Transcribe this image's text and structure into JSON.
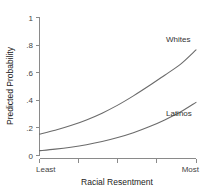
{
  "chart_data": {
    "type": "line",
    "title": "",
    "xlabel": "Racial Resentment",
    "ylabel": "Predicted Probability",
    "xlim": [
      0,
      1
    ],
    "ylim": [
      0,
      1
    ],
    "grid": false,
    "legend_position": "inline-right",
    "x_tick_labels": [
      "Least",
      "",
      "",
      "",
      "Most"
    ],
    "x_ticks": [
      0,
      0.25,
      0.5,
      0.75,
      1
    ],
    "y_ticks": [
      0,
      0.2,
      0.4,
      0.6,
      0.8,
      1
    ],
    "y_tick_labels": [
      "0",
      ".2",
      ".4",
      ".6",
      ".8",
      "1"
    ],
    "x": [
      0,
      0.1,
      0.2,
      0.3,
      0.4,
      0.5,
      0.6,
      0.7,
      0.8,
      0.9,
      1
    ],
    "series": [
      {
        "name": "Whites",
        "label": "Whites",
        "color": "#6b6b6b",
        "values": [
          0.155,
          0.183,
          0.217,
          0.258,
          0.307,
          0.365,
          0.432,
          0.505,
          0.582,
          0.66,
          0.765
        ]
      },
      {
        "name": "Latinos",
        "label": "Latinos",
        "color": "#6b6b6b",
        "values": [
          0.035,
          0.046,
          0.06,
          0.078,
          0.101,
          0.13,
          0.165,
          0.208,
          0.258,
          0.315,
          0.385
        ]
      }
    ]
  },
  "axes": {
    "y_title": "Predicted Probability",
    "x_title": "Racial Resentment",
    "y_labels": [
      "1",
      ".8",
      ".6",
      ".4",
      ".2",
      "0"
    ],
    "x_label_left": "Least",
    "x_label_right": "Most"
  },
  "annotations": {
    "whites": "Whites",
    "latinos": "Latinos"
  },
  "colors": {
    "axis": "#8a8a8a",
    "line": "#6b6b6b",
    "text": "#333333",
    "background": "#ffffff"
  }
}
